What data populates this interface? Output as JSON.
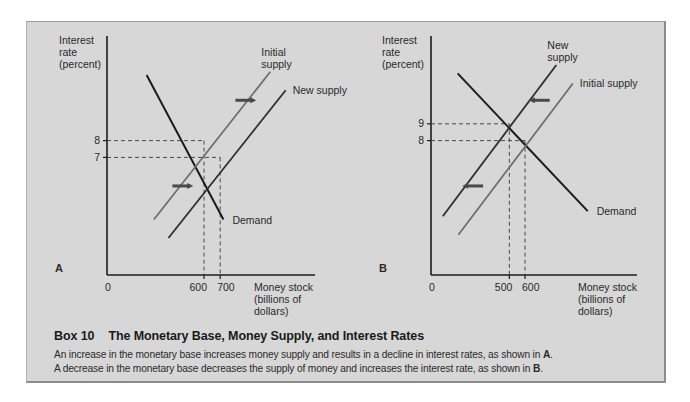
{
  "figure": {
    "box_label": "Box 10",
    "title": "The Monetary Base, Money Supply, and Interest Rates",
    "caption_lines": [
      {
        "text": "An increase in the monetary base increases money supply and results in a decline in interest rates, as shown in ",
        "ref": "A",
        "end": "."
      },
      {
        "text": "A decrease in the monetary base decreases the supply of money and increases the interest rate, as shown in ",
        "ref": "B",
        "end": "."
      }
    ],
    "colors": {
      "background": "#d7d7d7",
      "demand": "#1c1c1c",
      "initial_supply": "#6f6f6f",
      "new_supply": "#2e2e2e",
      "arrow": "#4a4a4a",
      "axis": "#1c1c1c",
      "guide": "#3a3a3a"
    }
  },
  "chart_data": [
    {
      "type": "line",
      "panel": "A",
      "title": "",
      "ylabel": [
        "Interest",
        "rate",
        "(percent)"
      ],
      "xlabel": [
        "Money stock",
        "(billions of",
        "dollars)"
      ],
      "origin_label": "0",
      "x_ticks": [
        600,
        700
      ],
      "x_tick_labels": [
        "600",
        "700"
      ],
      "y_ticks": [
        8,
        7
      ],
      "y_tick_labels": [
        "8",
        "7"
      ],
      "xlim": [
        0,
        1000
      ],
      "ylim": [
        0,
        14
      ],
      "grid": false,
      "series": [
        {
          "name": "Demand",
          "label": "Demand",
          "style": "demand",
          "points": [
            [
              245,
              11.9
            ],
            [
              720,
              3.3
            ]
          ],
          "label_at": "end"
        },
        {
          "name": "Initial supply",
          "label": "Initial supply",
          "style": "initial_supply",
          "points": [
            [
              290,
              3.3
            ],
            [
              1010,
              12.1
            ]
          ],
          "label_at": "top",
          "label_lines": [
            "Initial",
            "supply"
          ]
        },
        {
          "name": "New supply",
          "label": "New supply",
          "style": "new_supply",
          "points": [
            [
              380,
              2.2
            ],
            [
              1105,
              11.0
            ]
          ],
          "label_at": "top",
          "label_lines": [
            "New supply"
          ]
        }
      ],
      "equilibria": [
        {
          "x": 600,
          "y": 8
        },
        {
          "x": 700,
          "y": 7
        }
      ],
      "shift_arrows": [
        {
          "direction": "right",
          "at": [
            850,
            10.4
          ]
        },
        {
          "direction": "right",
          "at": [
            460,
            5.3
          ]
        }
      ]
    },
    {
      "type": "line",
      "panel": "B",
      "title": "",
      "ylabel": [
        "Interest",
        "rate",
        "(percent)"
      ],
      "xlabel": [
        "Money stock",
        "(billions of",
        "dollars)"
      ],
      "origin_label": "0",
      "x_ticks": [
        500,
        600
      ],
      "x_tick_labels": [
        "500",
        "600"
      ],
      "y_ticks": [
        9,
        8
      ],
      "y_tick_labels": [
        "9",
        "8"
      ],
      "xlim": [
        0,
        1000
      ],
      "ylim": [
        0,
        14
      ],
      "grid": false,
      "series": [
        {
          "name": "Demand",
          "label": "Demand",
          "style": "demand",
          "points": [
            [
              170,
              12.0
            ],
            [
              1000,
              3.8
            ]
          ],
          "label_at": "end"
        },
        {
          "name": "New supply",
          "label": "New supply",
          "style": "new_supply",
          "points": [
            [
              75,
              3.5
            ],
            [
              800,
              12.5
            ]
          ],
          "label_at": "top",
          "label_lines": [
            "New",
            "supply"
          ]
        },
        {
          "name": "Initial supply",
          "label": "Initial supply",
          "style": "initial_supply",
          "points": [
            [
              175,
              2.4
            ],
            [
              905,
              11.4
            ]
          ],
          "label_at": "top",
          "label_lines": [
            "Initial supply"
          ]
        }
      ],
      "equilibria": [
        {
          "x": 500,
          "y": 9
        },
        {
          "x": 600,
          "y": 8
        }
      ],
      "shift_arrows": [
        {
          "direction": "left",
          "at": [
            700,
            10.4
          ]
        },
        {
          "direction": "left",
          "at": [
            275,
            5.3
          ]
        }
      ]
    }
  ]
}
